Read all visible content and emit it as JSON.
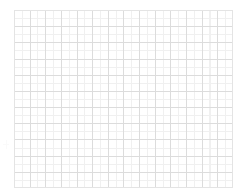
{
  "canvas": {
    "width": 245,
    "height": 195,
    "background_color": "#ffffff"
  },
  "chart_data": {
    "type": "line",
    "title": "",
    "subtitle": "",
    "xlabel": "",
    "ylabel": "",
    "categories": [],
    "values": [],
    "series": [],
    "annotations": [],
    "legend": {
      "visible": false,
      "position": "none",
      "entries": []
    },
    "axes": {
      "x": {
        "visible_ticks": false,
        "tick_labels": [],
        "range": null
      },
      "y": {
        "visible_ticks": false,
        "tick_labels": [],
        "range": null
      }
    },
    "grid": {
      "visible": true,
      "major": {
        "visible": true,
        "columns": 14,
        "rows": 11,
        "color": "#dcdcdc",
        "line_width": 1
      },
      "minor": {
        "visible": true,
        "subdivisions_x": 2,
        "subdivisions_y": 2,
        "color": "#f0f0f0",
        "line_width": 1
      },
      "border_color": "#e4e4e4"
    },
    "plot_box": {
      "left": 14,
      "top": 10,
      "width": 219,
      "height": 178,
      "cell_width": 15.64,
      "cell_height": 16.18,
      "minor_cell_width": 7.82,
      "minor_cell_height": 8.09
    },
    "state": "empty",
    "state_text": ""
  },
  "margin_mark": {
    "visible": true,
    "left": 3,
    "top": 140,
    "width": 6,
    "height": 9,
    "color": "#fafafa"
  }
}
